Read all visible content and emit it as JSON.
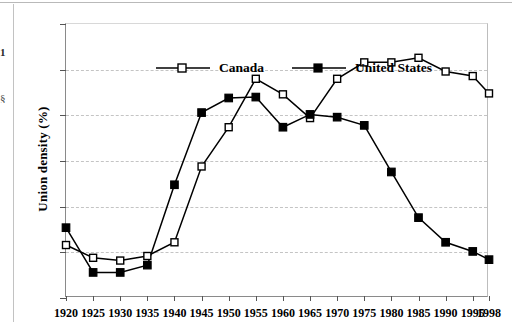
{
  "figure": {
    "ylabel": "Union density (%)",
    "artifact_fragments": [
      "1",
      "§"
    ]
  },
  "legend": {
    "position": "top-left-inside",
    "entries": [
      {
        "label": "Canada",
        "marker": "open-square",
        "color": "#000000"
      },
      {
        "label": "United States",
        "marker": "filled-square",
        "color": "#000000"
      }
    ]
  },
  "chart_data": {
    "type": "line",
    "title": "",
    "subtitle": "",
    "xlabel": "",
    "ylabel": "Union density (%)",
    "grid": true,
    "legend_position": "top-left",
    "xlim": [
      1920,
      1998
    ],
    "ylim": [
      10,
      40
    ],
    "yticks": [
      10,
      15,
      20,
      25,
      30,
      35,
      40
    ],
    "xticks": [
      1920,
      1925,
      1930,
      1935,
      1940,
      1945,
      1950,
      1955,
      1960,
      1965,
      1970,
      1975,
      1980,
      1985,
      1990,
      1995,
      1998
    ],
    "x": [
      1920,
      1925,
      1930,
      1935,
      1940,
      1945,
      1950,
      1955,
      1960,
      1965,
      1970,
      1975,
      1980,
      1985,
      1990,
      1995,
      1998
    ],
    "series": [
      {
        "name": "Canada",
        "marker": "open-square",
        "values": [
          15.8,
          14.4,
          14.1,
          14.6,
          16.1,
          24.4,
          28.7,
          34.0,
          32.3,
          29.7,
          34.0,
          35.8,
          35.8,
          36.3,
          34.8,
          34.3,
          32.4
        ]
      },
      {
        "name": "United States",
        "marker": "filled-square",
        "values": [
          17.7,
          12.8,
          12.8,
          13.6,
          22.4,
          30.3,
          31.9,
          32.0,
          28.7,
          30.1,
          29.8,
          28.9,
          23.8,
          18.8,
          16.1,
          15.1,
          14.2
        ]
      }
    ]
  }
}
